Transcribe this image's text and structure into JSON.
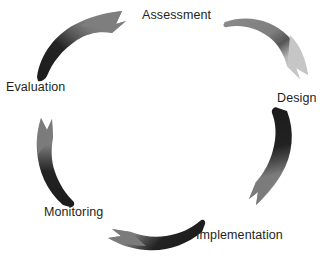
{
  "diagram": {
    "type": "circular-cycle",
    "background_color": "#ffffff",
    "text_color": "#231f20",
    "direction": "clockwise",
    "center": {
      "x": 164,
      "y": 132
    },
    "radius": 112,
    "stages": [
      {
        "id": "assessment",
        "label": "Assessment",
        "order": 1,
        "angle_deg": 0,
        "label_position": {
          "x": 142,
          "y": 8
        }
      },
      {
        "id": "design",
        "label": "Design",
        "order": 2,
        "angle_deg": 72,
        "label_position": {
          "x": 277,
          "y": 91
        }
      },
      {
        "id": "implementation",
        "label": "Implementation",
        "order": 3,
        "angle_deg": 144,
        "label_position": {
          "x": 196,
          "y": 228
        }
      },
      {
        "id": "monitoring",
        "label": "Monitoring",
        "order": 4,
        "angle_deg": 216,
        "label_position": {
          "x": 44,
          "y": 205
        }
      },
      {
        "id": "evaluation",
        "label": "Evaluation",
        "order": 5,
        "angle_deg": 288,
        "label_position": {
          "x": 6,
          "y": 80
        }
      }
    ],
    "arrows": [
      {
        "id": "arrow-evaluation-to-assessment",
        "from": "evaluation",
        "to": "assessment",
        "position": "top-left",
        "tail_color": "#262626",
        "head_color": "#7d7d7d",
        "points_toward": "Assessment"
      },
      {
        "id": "arrow-assessment-to-design",
        "from": "assessment",
        "to": "design",
        "position": "top-right",
        "tail_color": "#7d7d7d",
        "head_color": "#c4c4c4",
        "points_toward": "Design"
      },
      {
        "id": "arrow-design-to-implementation",
        "from": "design",
        "to": "implementation",
        "position": "right",
        "tail_color": "#262626",
        "head_color": "#7d7d7d",
        "points_toward": "Implementation"
      },
      {
        "id": "arrow-implementation-to-monitoring",
        "from": "implementation",
        "to": "monitoring",
        "position": "bottom",
        "tail_color": "#262626",
        "head_color": "#7d7d7d",
        "points_toward": "Monitoring"
      },
      {
        "id": "arrow-monitoring-to-evaluation",
        "from": "monitoring",
        "to": "evaluation",
        "position": "left",
        "tail_color": "#262626",
        "head_color": "#7d7d7d",
        "points_toward": "Evaluation"
      }
    ]
  }
}
